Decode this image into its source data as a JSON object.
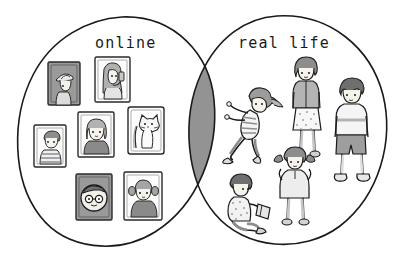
{
  "diagram": {
    "type": "venn",
    "background_color": "#ffffff",
    "stroke_color": "#1a1a1a",
    "overlap_fill": "#939393",
    "sets": [
      {
        "id": "online",
        "label": "online",
        "label_position": "top-left-circle",
        "content_type": "framed-avatar-portraits",
        "item_count": 7
      },
      {
        "id": "real-life",
        "label": "real life",
        "label_position": "top-right-circle",
        "content_type": "sketched-people-figures",
        "item_count": 5
      }
    ],
    "intersection": {
      "label": "",
      "fill": "#939393",
      "description": "solid gray lens"
    }
  },
  "online_items": [
    {
      "id": "frame-hat-person",
      "icon": "portrait-frame-icon",
      "frame_tone": "dark",
      "subject": "person in hat"
    },
    {
      "id": "frame-selfie-girl",
      "icon": "portrait-frame-icon",
      "frame_tone": "light",
      "subject": "girl taking selfie with phone"
    },
    {
      "id": "frame-striped-boy",
      "icon": "portrait-frame-icon",
      "frame_tone": "light",
      "subject": "boy in striped shirt"
    },
    {
      "id": "frame-bob-girl",
      "icon": "portrait-frame-icon",
      "frame_tone": "light",
      "subject": "girl with bob haircut"
    },
    {
      "id": "frame-cat",
      "icon": "portrait-frame-icon",
      "frame_tone": "light",
      "subject": "cat"
    },
    {
      "id": "frame-glasses-face",
      "icon": "portrait-frame-icon",
      "frame_tone": "dark",
      "subject": "round face with glasses"
    },
    {
      "id": "frame-pigtails-girl",
      "icon": "portrait-frame-icon",
      "frame_tone": "light",
      "subject": "girl with pigtails"
    }
  ],
  "real_life_items": [
    {
      "id": "figure-pushing-girl",
      "icon": "person-icon",
      "pose": "pushing against boundary",
      "subject": "girl in striped shirt"
    },
    {
      "id": "figure-standing-girl",
      "icon": "person-icon",
      "pose": "standing",
      "subject": "girl in skirt"
    },
    {
      "id": "figure-standing-boy",
      "icon": "person-icon",
      "pose": "standing",
      "subject": "boy in shorts"
    },
    {
      "id": "figure-pigtails-girl",
      "icon": "person-icon",
      "pose": "standing, hands up",
      "subject": "girl with pigtails"
    },
    {
      "id": "figure-reading-boy",
      "icon": "person-icon",
      "pose": "sitting and reading",
      "subject": "boy with book"
    }
  ],
  "labels": {
    "online": "online",
    "real_life": "real life"
  }
}
